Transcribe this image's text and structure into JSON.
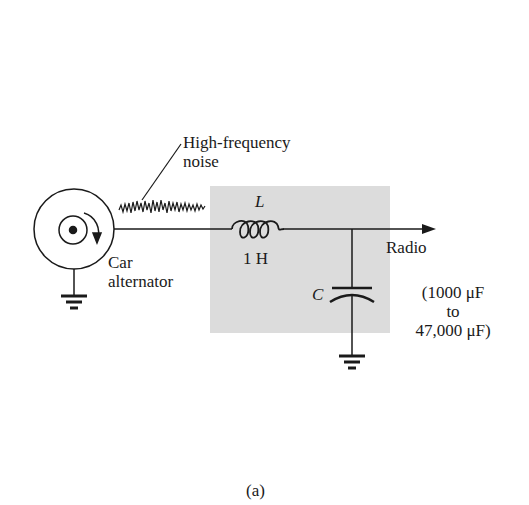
{
  "diagram": {
    "source": {
      "label_line1": "Car",
      "label_line2": "alternator"
    },
    "noise": {
      "label_line1": "High-frequency",
      "label_line2": "noise"
    },
    "inductor": {
      "symbol": "L",
      "value": "1 H"
    },
    "capacitor": {
      "symbol": "C",
      "range_line1": "(1000 μF",
      "range_line2": "to",
      "range_line3": "47,000 μF)"
    },
    "output": {
      "label": "Radio"
    },
    "caption": "(a)",
    "colors": {
      "filter_box": "#dcdcdc",
      "stroke": "#1a1a1a",
      "background": "#ffffff"
    }
  }
}
